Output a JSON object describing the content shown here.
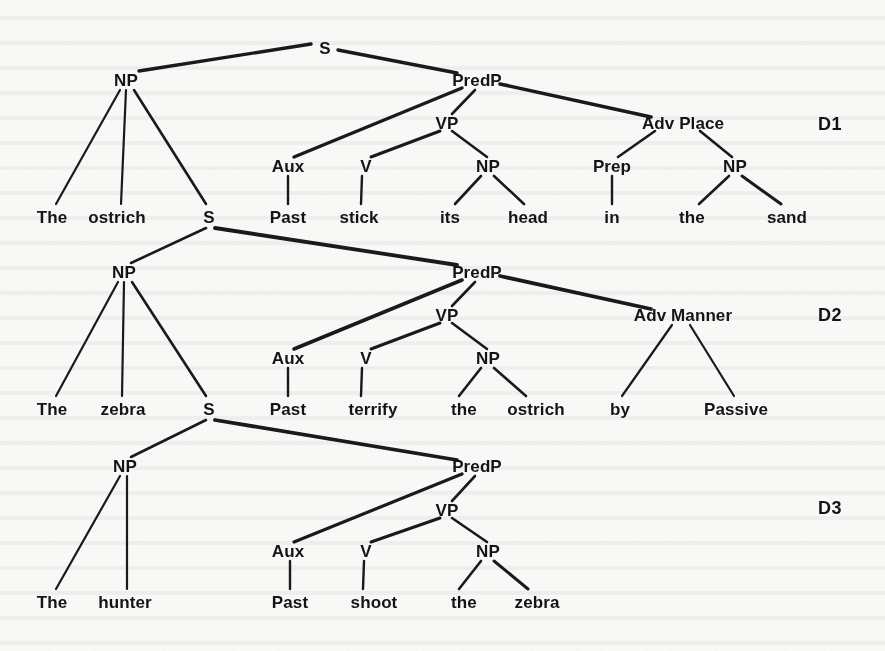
{
  "page": {
    "background_color": "#f8f8f7",
    "ink_color": "#141414",
    "width": 885,
    "height": 651
  },
  "diagrams": [
    {
      "tag": "D1",
      "tag_x": 830,
      "tag_y": 124,
      "sentence": "The ostrich Past stick its head in the sand",
      "nodes": [
        {
          "id": "d1-s",
          "label": "S",
          "x": 325,
          "y": 48
        },
        {
          "id": "d1-np",
          "label": "NP",
          "x": 126,
          "y": 80
        },
        {
          "id": "d1-predp",
          "label": "PredP",
          "x": 477,
          "y": 80
        },
        {
          "id": "d1-vp",
          "label": "VP",
          "x": 447,
          "y": 123
        },
        {
          "id": "d1-advplace",
          "label": "Adv Place",
          "x": 683,
          "y": 123
        },
        {
          "id": "d1-aux",
          "label": "Aux",
          "x": 288,
          "y": 166
        },
        {
          "id": "d1-v",
          "label": "V",
          "x": 366,
          "y": 166
        },
        {
          "id": "d1-np2",
          "label": "NP",
          "x": 488,
          "y": 166
        },
        {
          "id": "d1-prep",
          "label": "Prep",
          "x": 612,
          "y": 166
        },
        {
          "id": "d1-np3",
          "label": "NP",
          "x": 735,
          "y": 166
        }
      ],
      "terminals": [
        {
          "id": "d1-t1",
          "label": "The",
          "x": 52,
          "y": 217
        },
        {
          "id": "d1-t2",
          "label": "ostrich",
          "x": 117,
          "y": 217
        },
        {
          "id": "d1-t3",
          "label": "S",
          "x": 209,
          "y": 217
        },
        {
          "id": "d1-t4",
          "label": "Past",
          "x": 288,
          "y": 217
        },
        {
          "id": "d1-t5",
          "label": "stick",
          "x": 359,
          "y": 217
        },
        {
          "id": "d1-t6",
          "label": "its",
          "x": 450,
          "y": 217
        },
        {
          "id": "d1-t7",
          "label": "head",
          "x": 528,
          "y": 217
        },
        {
          "id": "d1-t8",
          "label": "in",
          "x": 612,
          "y": 217
        },
        {
          "id": "d1-t9",
          "label": "the",
          "x": 692,
          "y": 217
        },
        {
          "id": "d1-t10",
          "label": "sand",
          "x": 787,
          "y": 217
        }
      ],
      "edges": [
        {
          "from": "d1-s",
          "to": "d1-np",
          "x1": 311,
          "y1": 44,
          "x2": 139,
          "y2": 71,
          "w": 3.4
        },
        {
          "from": "d1-s",
          "to": "d1-predp",
          "x1": 338,
          "y1": 50,
          "x2": 457,
          "y2": 73,
          "w": 3.4
        },
        {
          "from": "d1-np",
          "to": "d1-t1",
          "x1": 120,
          "y1": 90,
          "x2": 56,
          "y2": 204,
          "w": 2.2
        },
        {
          "from": "d1-np",
          "to": "d1-t2",
          "x1": 126,
          "y1": 90,
          "x2": 121,
          "y2": 204,
          "w": 2.2
        },
        {
          "from": "d1-np",
          "to": "d1-t3",
          "x1": 134,
          "y1": 90,
          "x2": 206,
          "y2": 204,
          "w": 2.6
        },
        {
          "from": "d1-predp",
          "to": "d1-aux",
          "x1": 462,
          "y1": 88,
          "x2": 294,
          "y2": 157,
          "w": 3.4
        },
        {
          "from": "d1-predp",
          "to": "d1-vp",
          "x1": 475,
          "y1": 90,
          "x2": 452,
          "y2": 114,
          "w": 2.6
        },
        {
          "from": "d1-predp",
          "to": "d1-advplace",
          "x1": 500,
          "y1": 84,
          "x2": 651,
          "y2": 117,
          "w": 3.6
        },
        {
          "from": "d1-vp",
          "to": "d1-v",
          "x1": 440,
          "y1": 131,
          "x2": 371,
          "y2": 157,
          "w": 3.0
        },
        {
          "from": "d1-vp",
          "to": "d1-np2",
          "x1": 452,
          "y1": 131,
          "x2": 487,
          "y2": 157,
          "w": 2.6
        },
        {
          "from": "d1-advplace",
          "to": "d1-prep",
          "x1": 655,
          "y1": 131,
          "x2": 618,
          "y2": 157,
          "w": 2.6
        },
        {
          "from": "d1-advplace",
          "to": "d1-np3",
          "x1": 700,
          "y1": 131,
          "x2": 732,
          "y2": 157,
          "w": 2.6
        },
        {
          "from": "d1-aux",
          "to": "d1-t4",
          "x1": 288,
          "y1": 176,
          "x2": 288,
          "y2": 204,
          "w": 2.4
        },
        {
          "from": "d1-v",
          "to": "d1-t5",
          "x1": 362,
          "y1": 176,
          "x2": 361,
          "y2": 204,
          "w": 2.4
        },
        {
          "from": "d1-np2",
          "to": "d1-t6",
          "x1": 481,
          "y1": 176,
          "x2": 455,
          "y2": 204,
          "w": 2.6
        },
        {
          "from": "d1-np2",
          "to": "d1-t7",
          "x1": 494,
          "y1": 176,
          "x2": 524,
          "y2": 204,
          "w": 2.6
        },
        {
          "from": "d1-prep",
          "to": "d1-t8",
          "x1": 612,
          "y1": 176,
          "x2": 612,
          "y2": 204,
          "w": 2.4
        },
        {
          "from": "d1-np3",
          "to": "d1-t9",
          "x1": 729,
          "y1": 176,
          "x2": 699,
          "y2": 204,
          "w": 2.6
        },
        {
          "from": "d1-np3",
          "to": "d1-t10",
          "x1": 742,
          "y1": 176,
          "x2": 781,
          "y2": 204,
          "w": 3.0
        }
      ]
    },
    {
      "tag": "D2",
      "tag_x": 830,
      "tag_y": 315,
      "sentence": "The zebra Past terrify the ostrich by Passive",
      "nodes": [
        {
          "id": "d2-np",
          "label": "NP",
          "x": 124,
          "y": 272
        },
        {
          "id": "d2-predp",
          "label": "PredP",
          "x": 477,
          "y": 272
        },
        {
          "id": "d2-vp",
          "label": "VP",
          "x": 447,
          "y": 315
        },
        {
          "id": "d2-advmanner",
          "label": "Adv Manner",
          "x": 683,
          "y": 315
        },
        {
          "id": "d2-aux",
          "label": "Aux",
          "x": 288,
          "y": 358
        },
        {
          "id": "d2-v",
          "label": "V",
          "x": 366,
          "y": 358
        },
        {
          "id": "d2-np2",
          "label": "NP",
          "x": 488,
          "y": 358
        }
      ],
      "terminals": [
        {
          "id": "d2-t1",
          "label": "The",
          "x": 52,
          "y": 409
        },
        {
          "id": "d2-t2",
          "label": "zebra",
          "x": 123,
          "y": 409
        },
        {
          "id": "d2-t3",
          "label": "S",
          "x": 209,
          "y": 409
        },
        {
          "id": "d2-t4",
          "label": "Past",
          "x": 288,
          "y": 409
        },
        {
          "id": "d2-t5",
          "label": "terrify",
          "x": 373,
          "y": 409
        },
        {
          "id": "d2-t6",
          "label": "the",
          "x": 464,
          "y": 409
        },
        {
          "id": "d2-t7",
          "label": "ostrich",
          "x": 536,
          "y": 409
        },
        {
          "id": "d2-t8",
          "label": "by",
          "x": 620,
          "y": 409
        },
        {
          "id": "d2-t9",
          "label": "Passive",
          "x": 736,
          "y": 409
        }
      ],
      "edges": [
        {
          "from": "d1-t3",
          "to": "d2-np",
          "x1": 206,
          "y1": 228,
          "x2": 131,
          "y2": 263,
          "w": 2.6
        },
        {
          "from": "d1-t3",
          "to": "d2-predp",
          "x1": 215,
          "y1": 228,
          "x2": 457,
          "y2": 265,
          "w": 3.8
        },
        {
          "from": "d2-np",
          "to": "d2-t1",
          "x1": 118,
          "y1": 282,
          "x2": 56,
          "y2": 396,
          "w": 2.2
        },
        {
          "from": "d2-np",
          "to": "d2-t2",
          "x1": 124,
          "y1": 282,
          "x2": 122,
          "y2": 396,
          "w": 2.2
        },
        {
          "from": "d2-np",
          "to": "d2-t3",
          "x1": 132,
          "y1": 282,
          "x2": 206,
          "y2": 396,
          "w": 2.6
        },
        {
          "from": "d2-predp",
          "to": "d2-aux",
          "x1": 462,
          "y1": 280,
          "x2": 294,
          "y2": 349,
          "w": 3.6
        },
        {
          "from": "d2-predp",
          "to": "d2-vp",
          "x1": 475,
          "y1": 282,
          "x2": 452,
          "y2": 306,
          "w": 2.6
        },
        {
          "from": "d2-predp",
          "to": "d2-advmanner",
          "x1": 500,
          "y1": 276,
          "x2": 651,
          "y2": 309,
          "w": 3.8
        },
        {
          "from": "d2-vp",
          "to": "d2-v",
          "x1": 440,
          "y1": 323,
          "x2": 371,
          "y2": 349,
          "w": 3.0
        },
        {
          "from": "d2-vp",
          "to": "d2-np2",
          "x1": 452,
          "y1": 323,
          "x2": 487,
          "y2": 349,
          "w": 2.6
        },
        {
          "from": "d2-advmanner",
          "to": "d2-t8",
          "x1": 672,
          "y1": 325,
          "x2": 622,
          "y2": 396,
          "w": 2.2
        },
        {
          "from": "d2-advmanner",
          "to": "d2-t9",
          "x1": 690,
          "y1": 325,
          "x2": 734,
          "y2": 396,
          "w": 2.2
        },
        {
          "from": "d2-aux",
          "to": "d2-t4",
          "x1": 288,
          "y1": 368,
          "x2": 288,
          "y2": 396,
          "w": 2.4
        },
        {
          "from": "d2-v",
          "to": "d2-t5",
          "x1": 362,
          "y1": 368,
          "x2": 361,
          "y2": 396,
          "w": 2.4
        },
        {
          "from": "d2-np2",
          "to": "d2-t6",
          "x1": 481,
          "y1": 368,
          "x2": 459,
          "y2": 396,
          "w": 2.6
        },
        {
          "from": "d2-np2",
          "to": "d2-t7",
          "x1": 494,
          "y1": 368,
          "x2": 526,
          "y2": 396,
          "w": 2.6
        }
      ]
    },
    {
      "tag": "D3",
      "tag_x": 830,
      "tag_y": 508,
      "sentence": "The hunter Past shoot the zebra",
      "nodes": [
        {
          "id": "d3-np",
          "label": "NP",
          "x": 125,
          "y": 466
        },
        {
          "id": "d3-predp",
          "label": "PredP",
          "x": 477,
          "y": 466
        },
        {
          "id": "d3-vp",
          "label": "VP",
          "x": 447,
          "y": 510
        },
        {
          "id": "d3-aux",
          "label": "Aux",
          "x": 288,
          "y": 551
        },
        {
          "id": "d3-v",
          "label": "V",
          "x": 366,
          "y": 551
        },
        {
          "id": "d3-np2",
          "label": "NP",
          "x": 488,
          "y": 551
        }
      ],
      "terminals": [
        {
          "id": "d3-t1",
          "label": "The",
          "x": 52,
          "y": 602
        },
        {
          "id": "d3-t2",
          "label": "hunter",
          "x": 125,
          "y": 602
        },
        {
          "id": "d3-t3",
          "label": "Past",
          "x": 290,
          "y": 602
        },
        {
          "id": "d3-t4",
          "label": "shoot",
          "x": 374,
          "y": 602
        },
        {
          "id": "d3-t5",
          "label": "the",
          "x": 464,
          "y": 602
        },
        {
          "id": "d3-t6",
          "label": "zebra",
          "x": 537,
          "y": 602
        }
      ],
      "edges": [
        {
          "from": "d2-t3",
          "to": "d3-np",
          "x1": 206,
          "y1": 420,
          "x2": 131,
          "y2": 457,
          "w": 2.6
        },
        {
          "from": "d2-t3",
          "to": "d3-predp",
          "x1": 215,
          "y1": 420,
          "x2": 457,
          "y2": 460,
          "w": 3.8
        },
        {
          "from": "d3-np",
          "to": "d3-t1",
          "x1": 120,
          "y1": 476,
          "x2": 56,
          "y2": 589,
          "w": 2.2
        },
        {
          "from": "d3-np",
          "to": "d3-t2",
          "x1": 127,
          "y1": 476,
          "x2": 127,
          "y2": 589,
          "w": 2.2
        },
        {
          "from": "d3-predp",
          "to": "d3-aux",
          "x1": 462,
          "y1": 474,
          "x2": 294,
          "y2": 542,
          "w": 3.2
        },
        {
          "from": "d3-predp",
          "to": "d3-vp",
          "x1": 475,
          "y1": 476,
          "x2": 452,
          "y2": 501,
          "w": 2.6
        },
        {
          "from": "d3-vp",
          "to": "d3-v",
          "x1": 440,
          "y1": 518,
          "x2": 371,
          "y2": 542,
          "w": 3.0
        },
        {
          "from": "d3-vp",
          "to": "d3-np2",
          "x1": 452,
          "y1": 518,
          "x2": 487,
          "y2": 542,
          "w": 2.6
        },
        {
          "from": "d3-aux",
          "to": "d3-t3",
          "x1": 290,
          "y1": 561,
          "x2": 290,
          "y2": 589,
          "w": 2.4
        },
        {
          "from": "d3-v",
          "to": "d3-t4",
          "x1": 364,
          "y1": 561,
          "x2": 363,
          "y2": 589,
          "w": 2.4
        },
        {
          "from": "d3-np2",
          "to": "d3-t5",
          "x1": 481,
          "y1": 561,
          "x2": 459,
          "y2": 589,
          "w": 2.6
        },
        {
          "from": "d3-np2",
          "to": "d3-t6",
          "x1": 494,
          "y1": 561,
          "x2": 528,
          "y2": 589,
          "w": 3.0
        }
      ]
    }
  ]
}
